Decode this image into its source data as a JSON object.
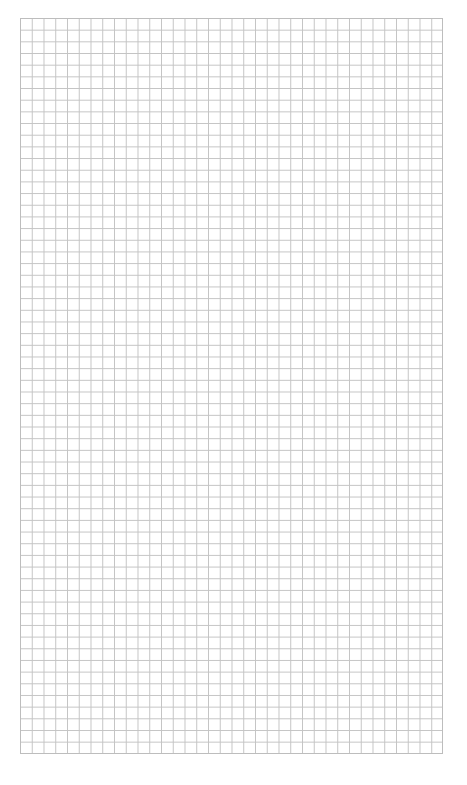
{
  "page": {
    "header_text": ""
  },
  "grid": {
    "columns": 36,
    "rows": 63,
    "cell_size_px": 11.7,
    "line_color": "#c4c4c4",
    "border_color": "#bdbdbd",
    "background_color": "#ffffff"
  }
}
